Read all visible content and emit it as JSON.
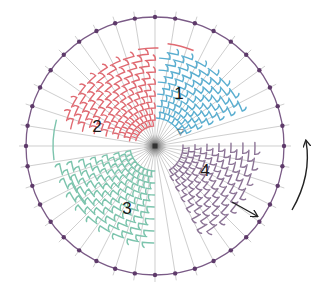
{
  "diagram": {
    "type": "radial-weaving",
    "center": {
      "x": 155,
      "y": 146
    },
    "radius": 129,
    "spoke_count": 40,
    "rim_color": "#7a5a86",
    "spoke_color": "#b9b9b9",
    "dot_color": "#5e3a6a",
    "hub_color": "#555555",
    "sections": [
      {
        "label": "1",
        "color": "#5aaed0",
        "label_pos": {
          "x": 179,
          "y": 95
        },
        "start_deg": -90,
        "end_deg": -25,
        "r_inner": 28,
        "r_outer": 95
      },
      {
        "label": "2",
        "color": "#e06a72",
        "label_pos": {
          "x": 97,
          "y": 128
        },
        "start_deg": -170,
        "end_deg": -95,
        "r_inner": 20,
        "r_outer": 92
      },
      {
        "label": "3",
        "color": "#7cc4ad",
        "label_pos": {
          "x": 127,
          "y": 210
        },
        "start_deg": 90,
        "end_deg": 165,
        "r_inner": 25,
        "r_outer": 100
      },
      {
        "label": "4",
        "color": "#8c7496",
        "label_pos": {
          "x": 205,
          "y": 172
        },
        "start_deg": -5,
        "end_deg": 60,
        "r_inner": 28,
        "r_outer": 105
      }
    ],
    "accent_arcs": [
      {
        "color": "#e06a72",
        "r": 103,
        "start_deg": -83,
        "end_deg": -68
      },
      {
        "color": "#e06a72",
        "r": 98,
        "start_deg": -100,
        "end_deg": -88
      },
      {
        "color": "#7cc4ad",
        "r": 102,
        "start_deg": 172,
        "end_deg": 195
      },
      {
        "color": "#7cc4ad",
        "r": 90,
        "start_deg": 140,
        "end_deg": 160
      }
    ],
    "start_marker": {
      "symbol": "▽",
      "x": 177,
      "y": 135
    },
    "arrows": [
      {
        "name": "straight-arrow",
        "from": {
          "x": 232,
          "y": 202
        },
        "to": {
          "x": 257,
          "y": 216
        }
      },
      {
        "name": "rotation-arrow",
        "from": {
          "x": 292,
          "y": 210
        },
        "to": {
          "x": 306,
          "y": 141
        }
      }
    ]
  }
}
